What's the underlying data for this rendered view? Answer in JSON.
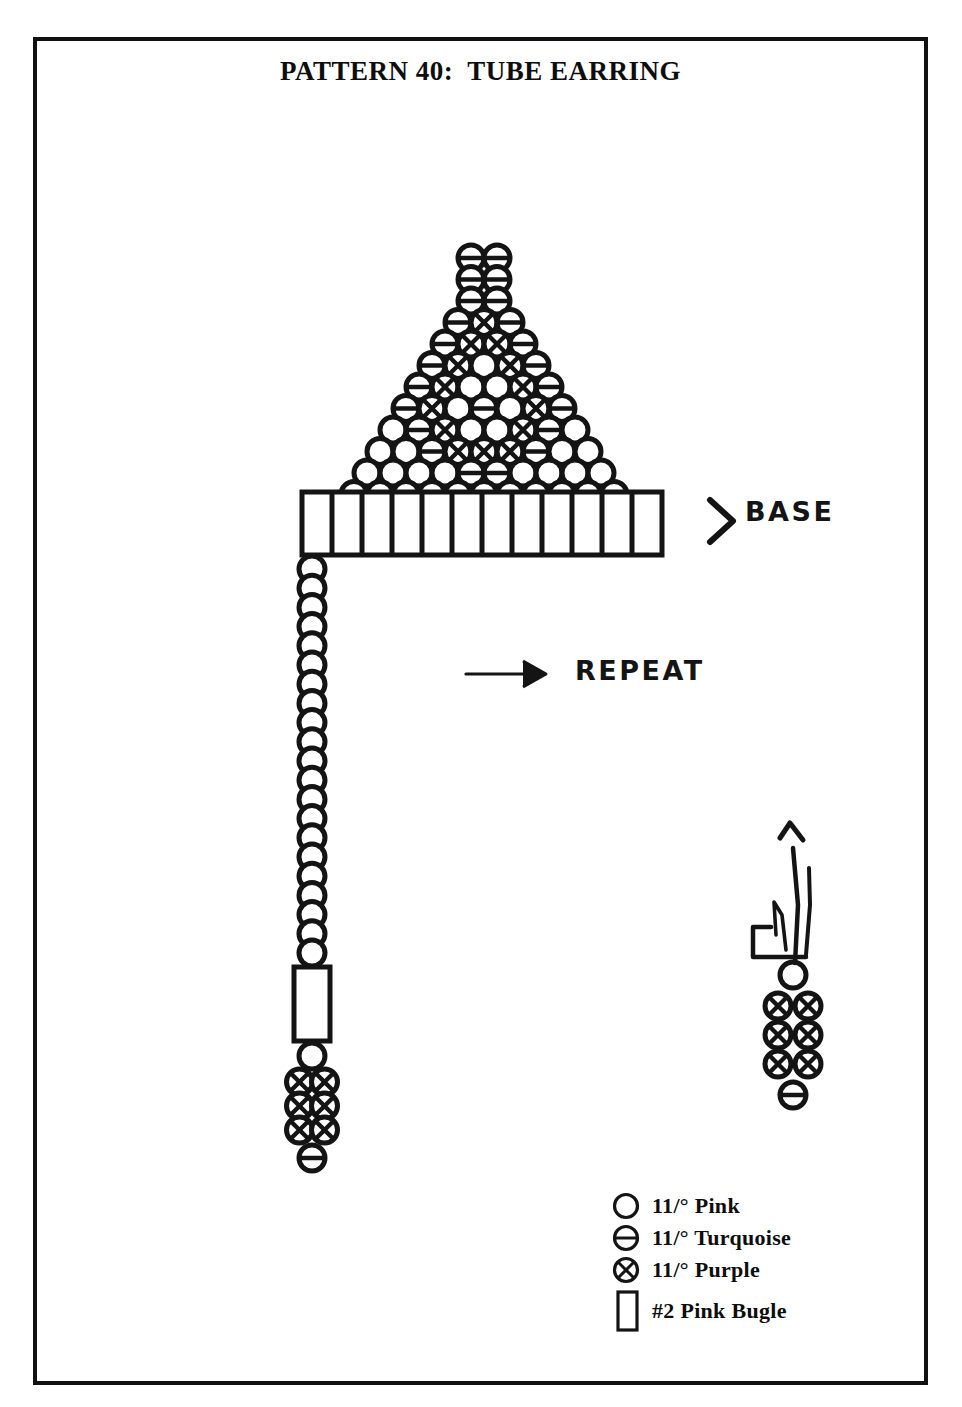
{
  "document": {
    "title": "PATTERN 40:  TUBE EARRING",
    "border_color": "#111111",
    "background_color": "#ffffff",
    "ink_color": "#141414"
  },
  "labels": {
    "base": "BASE",
    "repeat": "REPEAT"
  },
  "legend": {
    "items": [
      {
        "symbol": "circle-empty",
        "label": "11/° Pink",
        "bead": "pink"
      },
      {
        "symbol": "circle-bar",
        "label": "11/° Turquoise",
        "bead": "turquoise"
      },
      {
        "symbol": "circle-cross",
        "label": "11/° Purple",
        "bead": "purple"
      },
      {
        "symbol": "rectangle",
        "label": "#2 Pink Bugle",
        "bead": "bugle"
      }
    ]
  },
  "chart_data": {
    "type": "diagram",
    "title": "PATTERN 40:  TUBE EARRING",
    "bead_symbols": {
      "pink": "empty circle",
      "turquoise": "circle with horizontal bar",
      "purple": "circle with X",
      "bugle": "open rectangle"
    },
    "triangle": {
      "comment": "Brick-stitch triangle, top row first. Each row lists bead colors left to right.",
      "rows": [
        [
          "turquoise",
          "turquoise"
        ],
        [
          "turquoise",
          "turquoise"
        ],
        [
          "turquoise",
          "turquoise"
        ],
        [
          "turquoise",
          "purple",
          "turquoise"
        ],
        [
          "turquoise",
          "purple",
          "purple",
          "turquoise"
        ],
        [
          "turquoise",
          "purple",
          "pink",
          "purple",
          "turquoise"
        ],
        [
          "turquoise",
          "purple",
          "pink",
          "pink",
          "purple",
          "turquoise"
        ],
        [
          "turquoise",
          "purple",
          "pink",
          "turquoise",
          "pink",
          "purple",
          "turquoise"
        ],
        [
          "pink",
          "turquoise",
          "purple",
          "pink",
          "pink",
          "purple",
          "turquoise",
          "pink"
        ],
        [
          "pink",
          "pink",
          "turquoise",
          "purple",
          "purple",
          "purple",
          "turquoise",
          "pink",
          "pink"
        ],
        [
          "pink",
          "pink",
          "pink",
          "pink",
          "turquoise",
          "turquoise",
          "pink",
          "pink",
          "pink",
          "pink"
        ],
        [
          "pink",
          "pink",
          "pink",
          "pink",
          "pink",
          "pink",
          "pink",
          "pink",
          "pink",
          "pink",
          "pink"
        ]
      ],
      "row_count": 12,
      "bead_counts": [
        2,
        2,
        2,
        3,
        4,
        5,
        6,
        7,
        8,
        9,
        10,
        11
      ]
    },
    "base_bar": {
      "comment": "Row of #2 bugle beads forming the earring base",
      "bead": "bugle",
      "count": 12
    },
    "fringe": {
      "comment": "Vertical fringe strand hanging from left end of base",
      "chain_bead": "pink",
      "chain_count": 21,
      "bugle": {
        "bead": "bugle",
        "count": 1
      },
      "after_bugle": [
        {
          "bead": "pink",
          "count": 1
        }
      ],
      "cluster": {
        "bead": "purple",
        "columns": 2,
        "rows": 3
      },
      "tip": {
        "bead": "turquoise",
        "count": 1
      }
    },
    "thread_detail": {
      "comment": "Enlarged thread-path detail of the fringe tip cluster, needle exits upward",
      "top_bead": "pink",
      "cluster": {
        "bead": "purple",
        "columns": 2,
        "rows": 3
      },
      "tip": "turquoise",
      "arrow": "up"
    }
  }
}
